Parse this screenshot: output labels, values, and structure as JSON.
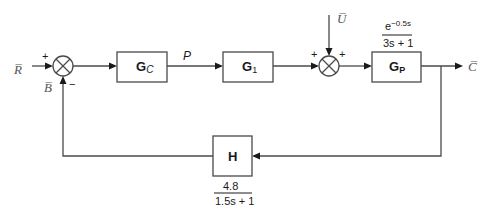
{
  "diagram": {
    "type": "feedback control block diagram",
    "signals": {
      "setpoint": "R̅",
      "measurement": "B̅",
      "controller_output": "P",
      "disturbance": "U̅",
      "output": "C̅"
    },
    "blocks": {
      "controller": {
        "label": "G",
        "subscript": "C"
      },
      "g1": {
        "label": "G",
        "subscript": "1"
      },
      "process": {
        "label": "G",
        "subscript": "P",
        "tf_numerator_base": "e",
        "tf_numerator_exp": "−0.5s",
        "tf_denominator": "3s + 1"
      },
      "feedback": {
        "label": "H",
        "tf_numerator": "4.8",
        "tf_denominator": "1.5s + 1"
      }
    },
    "junctions": {
      "sum1": {
        "sign_top": "+",
        "sign_bottom": "−"
      },
      "sum2": {
        "sign_left": "+",
        "sign_right": "+"
      }
    },
    "colors": {
      "line": "#4a4a4a",
      "text": "#1a1a1a",
      "signal_label": "#555555"
    }
  }
}
